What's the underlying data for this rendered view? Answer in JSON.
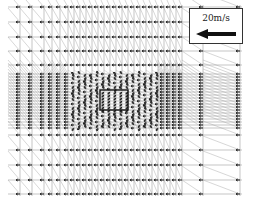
{
  "chart_data": {
    "type": "quiver",
    "title": "",
    "xlabel": "",
    "ylabel": "",
    "grid": true,
    "legend": {
      "position": "top-right",
      "scale_label": "20m/s",
      "scale_direction": "left"
    },
    "obstacle": {
      "x": [
        100,
        128
      ],
      "y": [
        90,
        110
      ]
    },
    "coarse_columns_x": [
      20,
      32,
      44,
      52,
      60,
      68,
      74,
      80,
      86,
      92,
      98,
      104,
      110,
      116,
      122,
      128,
      134,
      140,
      146,
      152,
      158,
      164,
      170,
      176,
      182,
      203,
      240
    ],
    "coarse_rows_y": [
      7,
      22,
      37,
      51,
      65,
      135,
      150,
      165,
      180,
      194
    ],
    "fine_rows_y_range": [
      74,
      128
    ],
    "fine_row_spacing": 3,
    "grid_extent": {
      "x": [
        8,
        245
      ],
      "y": [
        5,
        196
      ]
    }
  },
  "legend": {
    "label": "20m/s"
  }
}
